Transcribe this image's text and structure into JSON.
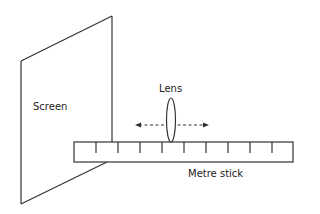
{
  "diagram": {
    "labels": {
      "screen": "Screen",
      "lens": "Lens",
      "metre_stick": "Metre stick"
    },
    "colors": {
      "stroke": "#333333",
      "background": "#ffffff"
    },
    "components": [
      {
        "id": "screen",
        "shape": "parallelogram"
      },
      {
        "id": "lens",
        "shape": "ellipse"
      },
      {
        "id": "movement-arrow",
        "shape": "double-headed-dashed-arrow"
      },
      {
        "id": "metre-stick",
        "shape": "ruler",
        "tick_count": 9
      }
    ]
  }
}
